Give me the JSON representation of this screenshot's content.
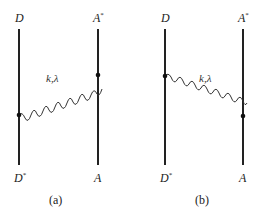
{
  "figure": {
    "panels": [
      {
        "id": "a",
        "caption": "(a)",
        "top_left_label": "D",
        "top_right_label": "A",
        "top_right_sup": "*",
        "bottom_left_label": "D",
        "bottom_left_sup": "*",
        "bottom_right_label": "A",
        "photon_label": "k,λ",
        "photon_from": "left-lower",
        "photon_to": "right-upper"
      },
      {
        "id": "b",
        "caption": "(b)",
        "top_left_label": "D",
        "top_right_label": "A",
        "top_right_sup": "*",
        "bottom_left_label": "D",
        "bottom_left_sup": "*",
        "bottom_right_label": "A",
        "photon_label": "k,λ",
        "photon_from": "left-upper",
        "photon_to": "right-lower"
      }
    ],
    "colors": {
      "line": "#222222",
      "photon": "#333333",
      "vertex": "#111111"
    }
  }
}
